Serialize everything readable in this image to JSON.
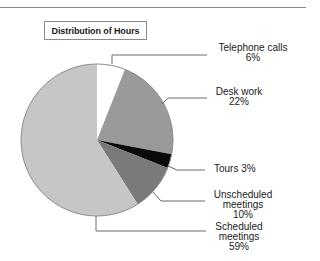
{
  "chart_data": {
    "type": "pie",
    "title": "Distribution of Hours",
    "start_angle": "12 o'clock, clockwise",
    "categories": [
      "Telephone calls",
      "Desk work",
      "Tours",
      "Unscheduled meetings",
      "Scheduled meetings"
    ],
    "values": [
      6,
      22,
      3,
      10,
      59
    ],
    "unit": "%",
    "colors": [
      "#ffffff",
      "#9a9a9a",
      "#0a0a0a",
      "#7a7a7a",
      "#c6c6c6"
    ],
    "labels": [
      {
        "lines": [
          "Telephone calls",
          "6%"
        ]
      },
      {
        "lines": [
          "Desk work",
          "22%"
        ]
      },
      {
        "lines": [
          "Tours 3%"
        ]
      },
      {
        "lines": [
          "Unscheduled",
          "meetings",
          "10%"
        ]
      },
      {
        "lines": [
          "Scheduled",
          "meetings",
          "59%"
        ]
      }
    ]
  },
  "title": "Distribution of Hours"
}
